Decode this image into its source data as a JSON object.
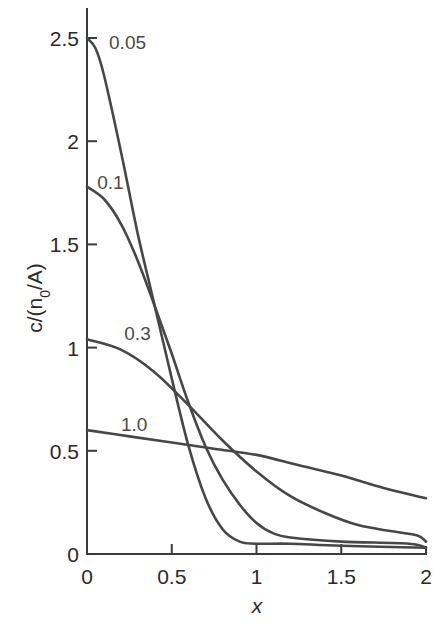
{
  "chart_data": {
    "type": "line",
    "title": "",
    "xlabel": "x",
    "ylabel": "c/(n0/A)",
    "ylabel_display": {
      "base": "c/(n",
      "sub": "0",
      "rest": "/A)"
    },
    "xlim": [
      0,
      2
    ],
    "ylim": [
      0,
      2.6
    ],
    "grid": false,
    "legend": "inline curve labels",
    "x_ticks": [
      "0",
      "0.5",
      "1",
      "1.5",
      "2"
    ],
    "y_ticks": [
      "0",
      "0.5",
      "1",
      "1.5",
      "2",
      "2.5"
    ],
    "series": [
      {
        "name": "0.05",
        "label": "0.05",
        "x": [
          0,
          0.05,
          0.1,
          0.2,
          0.3,
          0.4,
          0.5,
          0.6,
          0.7,
          0.8,
          0.9,
          1.0,
          1.2,
          1.5,
          2.0
        ],
        "y": [
          2.5,
          2.45,
          2.32,
          1.95,
          1.55,
          1.2,
          0.85,
          0.52,
          0.27,
          0.12,
          0.06,
          0.05,
          0.05,
          0.04,
          0.03
        ]
      },
      {
        "name": "0.1",
        "label": "0.1",
        "x": [
          0,
          0.1,
          0.2,
          0.3,
          0.4,
          0.5,
          0.6,
          0.7,
          0.8,
          0.9,
          1.0,
          1.1,
          1.2,
          1.5,
          1.9,
          2.0
        ],
        "y": [
          1.78,
          1.72,
          1.6,
          1.42,
          1.2,
          0.97,
          0.73,
          0.52,
          0.36,
          0.24,
          0.15,
          0.1,
          0.08,
          0.06,
          0.05,
          0.03
        ]
      },
      {
        "name": "0.3",
        "label": "0.3",
        "x": [
          0,
          0.2,
          0.4,
          0.6,
          0.8,
          1.0,
          1.2,
          1.4,
          1.6,
          1.8,
          1.95,
          2.0
        ],
        "y": [
          1.04,
          0.99,
          0.88,
          0.72,
          0.55,
          0.4,
          0.28,
          0.2,
          0.14,
          0.11,
          0.09,
          0.06
        ]
      },
      {
        "name": "1.0",
        "label": "1.0",
        "x": [
          0,
          0.25,
          0.5,
          0.75,
          1.0,
          1.25,
          1.5,
          1.75,
          2.0
        ],
        "y": [
          0.6,
          0.57,
          0.54,
          0.51,
          0.48,
          0.43,
          0.38,
          0.32,
          0.27
        ]
      }
    ],
    "annotations": [
      {
        "text": "0.05",
        "x": 0.13,
        "y": 2.48
      },
      {
        "text": "0.1",
        "x": 0.06,
        "y": 1.8
      },
      {
        "text": "0.3",
        "x": 0.22,
        "y": 1.07
      },
      {
        "text": "1.0",
        "x": 0.2,
        "y": 0.63
      }
    ],
    "style": {
      "line_color": "#474747",
      "axis_color": "#3a3a3a",
      "background": "#ffffff"
    }
  }
}
